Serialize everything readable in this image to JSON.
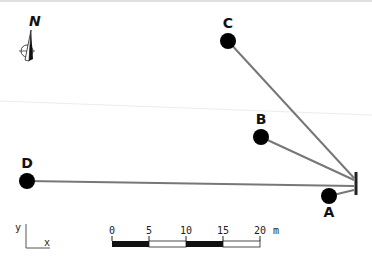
{
  "diagram": {
    "colors": {
      "line": "#777777",
      "node": "#000000",
      "receiver": "#222222",
      "background": "#ffffff",
      "faint": "#e6e6e6"
    },
    "north_label": "N",
    "receiver": {
      "x": 356,
      "y1": 172,
      "y2": 195
    },
    "nodes": [
      {
        "id": "C",
        "label": "C",
        "cx": 228,
        "cy": 41,
        "lx": 228,
        "ly": 28,
        "ty": 178
      },
      {
        "id": "B",
        "label": "B",
        "cx": 261,
        "cy": 137,
        "lx": 261,
        "ly": 124,
        "ty": 180
      },
      {
        "id": "D",
        "label": "D",
        "cx": 27,
        "cy": 181,
        "lx": 27,
        "ly": 168,
        "ty": 186
      },
      {
        "id": "A",
        "label": "A",
        "cx": 329,
        "cy": 196,
        "lx": 329,
        "ly": 217,
        "ty": 190
      }
    ],
    "axes": {
      "y_label": "y",
      "x_label": "x"
    },
    "scale_bar": {
      "ticks": [
        "0",
        "5",
        "10",
        "15",
        "20"
      ],
      "unit": "m"
    }
  }
}
